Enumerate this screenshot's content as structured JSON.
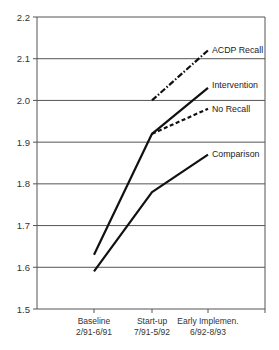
{
  "chart_data": {
    "type": "line",
    "title": "",
    "xlabel": "",
    "ylabel": "",
    "ylim": [
      1.5,
      2.2
    ],
    "yticks": [
      "1.5",
      "1.6",
      "1.7",
      "1.8",
      "1.9",
      "2.0",
      "2.1",
      "2.2"
    ],
    "grid": true,
    "legend_position": "inline-right",
    "categories": [
      {
        "line1": "Baseline",
        "line2": "2/91-6/91"
      },
      {
        "line1": "Start-up",
        "line2": "7/91-5/92"
      },
      {
        "line1": "Early Implemen.",
        "line2": "6/92-8/93"
      }
    ],
    "series": [
      {
        "name": "ACDP Recall",
        "style": "dash-dot",
        "values": [
          null,
          2.0,
          2.12
        ]
      },
      {
        "name": "Intervention",
        "style": "solid",
        "values": [
          1.63,
          1.92,
          2.03
        ]
      },
      {
        "name": "No Recall",
        "style": "dashed",
        "values": [
          null,
          1.92,
          1.98
        ]
      },
      {
        "name": "Comparison",
        "style": "solid",
        "values": [
          1.59,
          1.78,
          1.87
        ]
      }
    ],
    "colors": {
      "line": "#111111",
      "grid": "#555555",
      "text": "#333333"
    }
  }
}
